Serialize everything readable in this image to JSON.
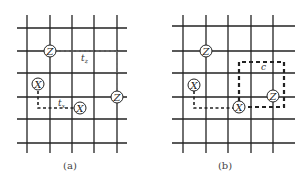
{
  "figure": {
    "panel_a": {
      "caption": "(a)",
      "node_labels": {
        "z1": "Z",
        "z2": "Z",
        "x1": "X",
        "x2": "X"
      },
      "path_labels": {
        "tz": "t",
        "tz_sub": "z",
        "tx": "t",
        "tx_sub": "x"
      }
    },
    "panel_b": {
      "caption": "(b)",
      "node_labels": {
        "z1": "Z",
        "z2": "Z",
        "x1": "X",
        "x2": "X"
      },
      "loop_label": "c"
    },
    "colors": {
      "line": "#222222",
      "background": "#ffffff"
    }
  }
}
